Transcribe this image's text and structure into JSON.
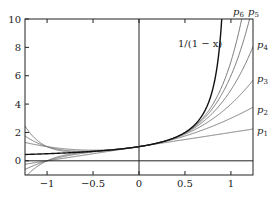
{
  "chart_data": {
    "type": "line",
    "title": "",
    "xlabel": "",
    "ylabel": "",
    "xlim": [
      -1.24,
      1.24
    ],
    "ylim": [
      -1,
      10
    ],
    "grid": false,
    "x_ticks": [
      -1,
      -0.5,
      0,
      0.5,
      1
    ],
    "x_tick_labels": [
      "−1",
      "−0.5",
      "0",
      "0.5",
      "1"
    ],
    "y_ticks": [
      0,
      2,
      4,
      6,
      8,
      10
    ],
    "y_tick_labels": [
      "0",
      "2",
      "4",
      "6",
      "8",
      "10"
    ],
    "function": {
      "label": "1/(1 − x)",
      "expr": "1/(1-x)",
      "color": "#111111"
    },
    "series": [
      {
        "name": "p1",
        "degree": 1,
        "color": "#7a7a7a"
      },
      {
        "name": "p2",
        "degree": 2,
        "color": "#7a7a7a"
      },
      {
        "name": "p3",
        "degree": 3,
        "color": "#7a7a7a"
      },
      {
        "name": "p4",
        "degree": 4,
        "color": "#7a7a7a"
      },
      {
        "name": "p5",
        "degree": 5,
        "color": "#7a7a7a"
      },
      {
        "name": "p6",
        "degree": 6,
        "color": "#7a7a7a"
      }
    ],
    "annotations": [
      {
        "text": "1/(1 − x)",
        "x": 178,
        "y": 47
      },
      {
        "text": "p",
        "sub": "6",
        "x": 233,
        "y": 15
      },
      {
        "text": "p",
        "sub": "5",
        "x": 248,
        "y": 15
      },
      {
        "text": "p",
        "sub": "4",
        "x": 257,
        "y": 48
      },
      {
        "text": "p",
        "sub": "3",
        "x": 257,
        "y": 82
      },
      {
        "text": "p",
        "sub": "2",
        "x": 257,
        "y": 113
      },
      {
        "text": "p",
        "sub": "1",
        "x": 257,
        "y": 134
      }
    ],
    "reference_lines": [
      {
        "orientation": "horizontal",
        "value": 0
      },
      {
        "orientation": "vertical",
        "value": 0
      }
    ]
  }
}
